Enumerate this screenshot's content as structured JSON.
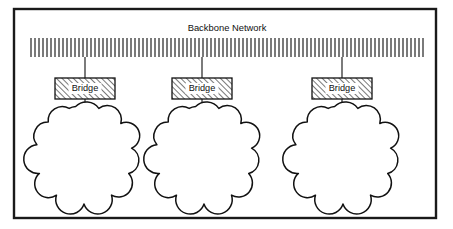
{
  "diagram": {
    "title": "Backbone Network",
    "frame": {
      "x": 14,
      "y": 9,
      "width": 422,
      "height": 209,
      "stroke_color": "#1a1a1a"
    },
    "backbone": {
      "label": "Backbone Network",
      "x": 30,
      "y": 38,
      "width": 394,
      "height": 19,
      "stripe_spacing": 4,
      "stripe_color": "#2a2a2a",
      "icon": "striped-bus-bar"
    },
    "title_position": {
      "x": 227,
      "y": 31
    },
    "bridges": [
      {
        "id": "bridge-1",
        "label": "Bridge",
        "x": 55,
        "y": 78,
        "width": 60,
        "height": 21,
        "fill_pattern": "diagonal-hatch",
        "drop_x": 85
      },
      {
        "id": "bridge-2",
        "label": "Bridge",
        "x": 172,
        "y": 78,
        "width": 60,
        "height": 21,
        "fill_pattern": "diagonal-hatch",
        "drop_x": 202
      },
      {
        "id": "bridge-3",
        "label": "Bridge",
        "x": 312,
        "y": 78,
        "width": 60,
        "height": 21,
        "fill_pattern": "diagonal-hatch",
        "drop_x": 342
      }
    ],
    "clouds": [
      {
        "id": "cloud-1",
        "icon": "network-cloud",
        "cx": 84,
        "cy": 155,
        "rx": 46,
        "ry": 47
      },
      {
        "id": "cloud-2",
        "icon": "network-cloud",
        "cx": 204,
        "cy": 155,
        "rx": 46,
        "ry": 47
      },
      {
        "id": "cloud-3",
        "icon": "network-cloud",
        "cx": 343,
        "cy": 155,
        "rx": 46,
        "ry": 47
      }
    ],
    "connectors": [
      {
        "id": "connector-backbone-bridge-1",
        "x": 85,
        "y1": 57,
        "y2": 78
      },
      {
        "id": "connector-backbone-bridge-2",
        "x": 202,
        "y1": 57,
        "y2": 78
      },
      {
        "id": "connector-backbone-bridge-3",
        "x": 342,
        "y1": 57,
        "y2": 78
      },
      {
        "id": "connector-bridge-cloud-1",
        "x": 85,
        "y1": 99,
        "y2": 112
      },
      {
        "id": "connector-bridge-cloud-2",
        "x": 202,
        "y1": 99,
        "y2": 112
      },
      {
        "id": "connector-bridge-cloud-3",
        "x": 342,
        "y1": 99,
        "y2": 112
      }
    ],
    "colors": {
      "background": "#ffffff",
      "line": "#111111",
      "frame": "#1a1a1a",
      "text": "#101010"
    }
  }
}
